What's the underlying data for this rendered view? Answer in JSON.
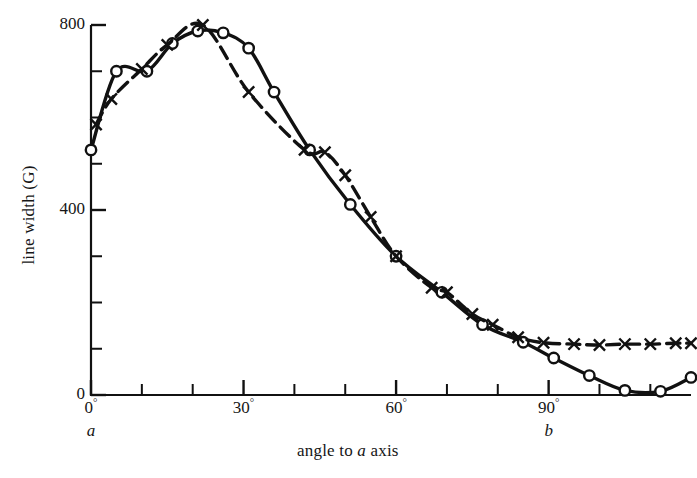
{
  "figure": {
    "background": "#ffffff",
    "ink": "#111111"
  },
  "axes": {
    "y_title": "line width (G)",
    "x_title_prefix": "angle to ",
    "x_title_italic": "a",
    "x_title_suffix": " axis",
    "y_tick_labels": [
      "0",
      "400",
      "800"
    ],
    "x_tick_labels": [
      "0",
      "30",
      "60",
      "90"
    ],
    "degree_symbol": "°",
    "axis_letters": [
      "a",
      "b"
    ]
  },
  "chart_data": {
    "type": "line",
    "title": "",
    "xlabel": "angle to a axis",
    "ylabel": "line width (G)",
    "xlim": [
      0,
      118
    ],
    "ylim": [
      0,
      830
    ],
    "x_major_ticks": [
      0,
      30,
      60,
      90
    ],
    "x_minor_ticks": [
      0,
      10,
      20,
      30,
      40,
      50,
      60,
      70,
      80,
      90,
      100,
      110
    ],
    "y_major_ticks": [
      0,
      400,
      800
    ],
    "y_minor_ticks": [
      0,
      100,
      200,
      300,
      400,
      500,
      600,
      700,
      800
    ],
    "x_unit": "degrees",
    "y_unit": "G",
    "grid": false,
    "legend": "none",
    "annotations": [
      {
        "text": "a",
        "x": 0,
        "note": "crystal axis marker below 0 degrees"
      },
      {
        "text": "b",
        "x": 90,
        "note": "crystal axis marker below 90 degrees"
      }
    ],
    "series": [
      {
        "name": "circles",
        "marker": "circle-open",
        "linestyle": "solid",
        "points": [
          {
            "x": 0,
            "y": 530
          },
          {
            "x": 5,
            "y": 700
          },
          {
            "x": 11,
            "y": 700
          },
          {
            "x": 16,
            "y": 760
          },
          {
            "x": 21,
            "y": 787
          },
          {
            "x": 26,
            "y": 783
          },
          {
            "x": 31,
            "y": 750
          },
          {
            "x": 36,
            "y": 655
          },
          {
            "x": 43,
            "y": 530
          },
          {
            "x": 51,
            "y": 412
          },
          {
            "x": 60,
            "y": 300
          },
          {
            "x": 69,
            "y": 222
          },
          {
            "x": 77,
            "y": 152
          },
          {
            "x": 85,
            "y": 114
          },
          {
            "x": 91,
            "y": 80
          },
          {
            "x": 98,
            "y": 42
          },
          {
            "x": 105,
            "y": 10
          },
          {
            "x": 112,
            "y": 8
          },
          {
            "x": 118,
            "y": 38
          }
        ]
      },
      {
        "name": "crosses",
        "marker": "cross",
        "linestyle": "dashed",
        "points": [
          {
            "x": 1,
            "y": 585
          },
          {
            "x": 4,
            "y": 640
          },
          {
            "x": 10,
            "y": 705
          },
          {
            "x": 15,
            "y": 757
          },
          {
            "x": 22,
            "y": 800
          },
          {
            "x": 31,
            "y": 655
          },
          {
            "x": 42,
            "y": 530
          },
          {
            "x": 46,
            "y": 525
          },
          {
            "x": 50,
            "y": 475
          },
          {
            "x": 55,
            "y": 385
          },
          {
            "x": 60,
            "y": 300
          },
          {
            "x": 67,
            "y": 232
          },
          {
            "x": 70,
            "y": 222
          },
          {
            "x": 75,
            "y": 175
          },
          {
            "x": 79,
            "y": 152
          },
          {
            "x": 84,
            "y": 125
          },
          {
            "x": 89,
            "y": 113
          },
          {
            "x": 95,
            "y": 110
          },
          {
            "x": 100,
            "y": 108
          },
          {
            "x": 105,
            "y": 110
          },
          {
            "x": 110,
            "y": 110
          },
          {
            "x": 115,
            "y": 112
          },
          {
            "x": 118,
            "y": 112
          }
        ]
      }
    ]
  }
}
